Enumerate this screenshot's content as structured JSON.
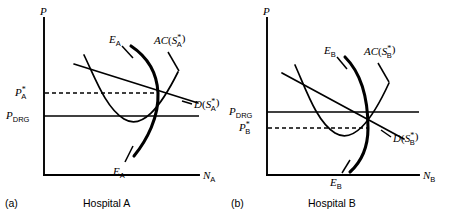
{
  "figure": {
    "type": "diagram",
    "panels": [
      {
        "id": "a",
        "panel_label": "(a)",
        "caption": "Hospital A",
        "y_axis_label": "P",
        "x_axis_label_base": "N",
        "x_axis_label_sub": "A",
        "price_star_base": "P",
        "price_star_sub": "A",
        "price_star_sup": "*",
        "drg_base": "P",
        "drg_sub": "DRG",
        "e_curve_label_base": "E",
        "e_curve_label_sub": "A",
        "ac_curve_label_prefix": "AC",
        "ac_curve_label_inner": "S",
        "ac_curve_label_sub": "A",
        "ac_curve_label_sup": "*",
        "d_curve_label_prefix": "D",
        "d_curve_label_inner": "S",
        "d_curve_label_sub": "A",
        "d_curve_label_sup": "*",
        "relation": "P*_A above P_DRG"
      },
      {
        "id": "b",
        "panel_label": "(b)",
        "caption": "Hospital B",
        "y_axis_label": "P",
        "x_axis_label_base": "N",
        "x_axis_label_sub": "B",
        "price_star_base": "P",
        "price_star_sub": "B",
        "price_star_sup": "*",
        "drg_base": "P",
        "drg_sub": "DRG",
        "e_curve_label_base": "E",
        "e_curve_label_sub": "B",
        "ac_curve_label_prefix": "AC",
        "ac_curve_label_inner": "S",
        "ac_curve_label_sub": "B",
        "ac_curve_label_sup": "*",
        "d_curve_label_prefix": "D",
        "d_curve_label_inner": "S",
        "d_curve_label_sub": "B",
        "d_curve_label_sup": "*",
        "relation": "P*_B below P_DRG"
      }
    ],
    "colors": {
      "ink": "#000000",
      "background": "#ffffff"
    }
  }
}
